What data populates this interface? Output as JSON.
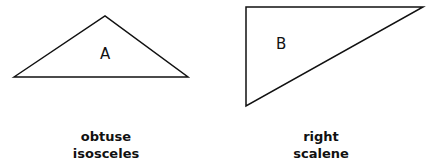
{
  "figure": {
    "triangles": [
      {
        "id": "A",
        "label": "A",
        "caption_line1": "obtuse",
        "caption_line2": "isosceles",
        "points": [
          [
            14,
            77
          ],
          [
            105,
            16
          ],
          [
            188,
            77
          ]
        ]
      },
      {
        "id": "B",
        "label": "B",
        "caption_line1": "right",
        "caption_line2": "scalene",
        "points": [
          [
            246,
            7
          ],
          [
            423,
            7
          ],
          [
            246,
            106
          ]
        ]
      }
    ],
    "stroke_color": "#111111"
  }
}
